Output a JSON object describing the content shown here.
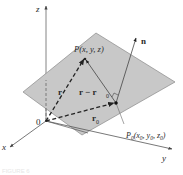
{
  "figure": {
    "type": "3d-plane-normal-vector",
    "caption": "FIGURE 6"
  },
  "axes": {
    "x_label": "x",
    "y_label": "y",
    "z_label": "z",
    "origin_label": "0"
  },
  "points": {
    "P": "P(x, y, z)",
    "P0_name": "P",
    "P0_sub": "0",
    "P0_coords": "(x",
    "P0_full": "P0(x0, y0, z0)"
  },
  "vectors": {
    "r": "r",
    "r_minus_r0": "r − r",
    "r0": "r",
    "sub0": "0",
    "n": "n"
  },
  "colors": {
    "plane_fill": "#c8c8c8",
    "plane_edge": "#8a8a8a",
    "axis": "#555555",
    "vector": "#222222",
    "background": "#ffffff"
  }
}
